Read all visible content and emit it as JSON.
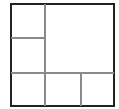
{
  "diagram": {
    "type": "square-partition",
    "colors": {
      "outer_border": "#222222",
      "inner_lines": "#8a8a8a",
      "background": "#ffffff"
    },
    "regions": [
      {
        "id": "top-left-small",
        "label": ""
      },
      {
        "id": "middle-left-small",
        "label": ""
      },
      {
        "id": "top-right-large",
        "label": ""
      },
      {
        "id": "bottom-left",
        "label": ""
      },
      {
        "id": "bottom-middle",
        "label": ""
      },
      {
        "id": "bottom-right",
        "label": ""
      }
    ]
  }
}
